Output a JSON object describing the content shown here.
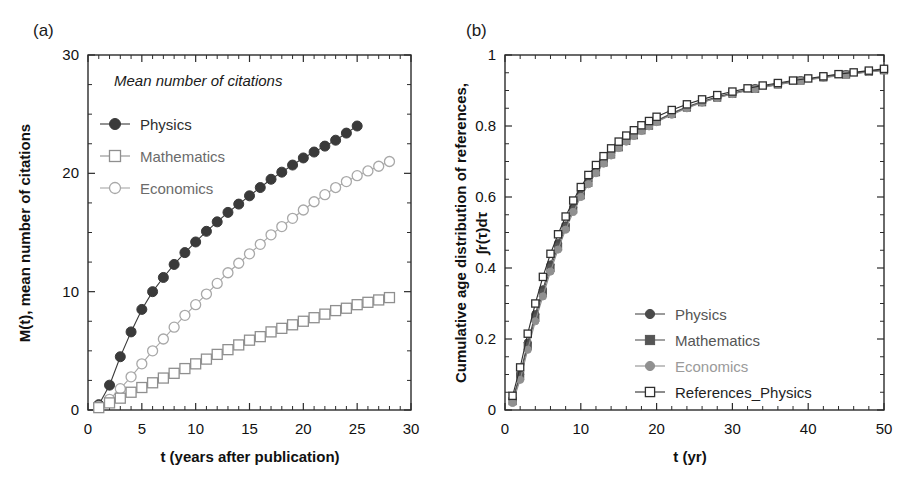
{
  "figure": {
    "panel_a_tag": "(a)",
    "panel_b_tag": "(b)"
  },
  "panel_a": {
    "legend_title": "Mean number of citations",
    "xlabel": "t (years after publication)",
    "ylabel": "M(t), mean number of citations",
    "xticks": [
      "0",
      "5",
      "10",
      "15",
      "20",
      "25",
      "30"
    ],
    "yticks": [
      "0",
      "10",
      "20",
      "30"
    ],
    "legend": [
      {
        "label": "Physics",
        "marker": "filled-circle",
        "color": "#3a3a3a"
      },
      {
        "label": "Mathematics",
        "marker": "open-square",
        "color": "#8f8f8f"
      },
      {
        "label": "Economics",
        "marker": "open-circle",
        "color": "#a8a8a8"
      }
    ]
  },
  "panel_b": {
    "xlabel": "t (yr)",
    "ylabel_line1": "Cumulative age distribution of references,",
    "ylabel_line2": "∫r(τ)dτ",
    "xticks": [
      "0",
      "10",
      "20",
      "30",
      "40",
      "50"
    ],
    "yticks": [
      "0",
      "0.2",
      "0.4",
      "0.6",
      "0.8",
      "1"
    ],
    "legend": [
      {
        "label": "Physics",
        "marker": "filled-circle",
        "color": "#4a4a4a"
      },
      {
        "label": "Mathematics",
        "marker": "filled-square",
        "color": "#555555"
      },
      {
        "label": "Economics",
        "marker": "filled-circle",
        "color": "#909090"
      },
      {
        "label": "References_Physics",
        "marker": "open-square",
        "color": "#2f2f2f"
      }
    ]
  },
  "chart_data": [
    {
      "type": "line",
      "panel": "(a)",
      "title": "Mean number of citations",
      "xlabel": "t (years after publication)",
      "ylabel": "M(t), mean number of citations",
      "xlim": [
        0,
        30
      ],
      "ylim": [
        0,
        30
      ],
      "xticks": [
        0,
        5,
        10,
        15,
        20,
        25,
        30
      ],
      "yticks": [
        0,
        10,
        20,
        30
      ],
      "grid": false,
      "legend_position": "upper-left",
      "series": [
        {
          "name": "Physics",
          "marker": "filled-circle",
          "color": "#3a3a3a",
          "x": [
            1,
            2,
            3,
            4,
            5,
            6,
            7,
            8,
            9,
            10,
            11,
            12,
            13,
            14,
            15,
            16,
            17,
            18,
            19,
            20,
            21,
            22,
            23,
            24,
            25
          ],
          "y": [
            0.45,
            2.1,
            4.5,
            6.6,
            8.5,
            10.0,
            11.2,
            12.3,
            13.3,
            14.2,
            15.1,
            15.9,
            16.7,
            17.4,
            18.1,
            18.8,
            19.5,
            20.1,
            20.7,
            21.3,
            21.8,
            22.3,
            22.8,
            23.4,
            24.0
          ]
        },
        {
          "name": "Economics",
          "marker": "open-circle",
          "color": "#a8a8a8",
          "x": [
            1,
            2,
            3,
            4,
            5,
            6,
            7,
            8,
            9,
            10,
            11,
            12,
            13,
            14,
            15,
            16,
            17,
            18,
            19,
            20,
            21,
            22,
            23,
            24,
            25,
            26,
            27,
            28
          ],
          "y": [
            0.3,
            0.9,
            1.8,
            2.8,
            3.9,
            5.0,
            6.0,
            7.0,
            8.0,
            8.9,
            9.8,
            10.7,
            11.6,
            12.4,
            13.2,
            14.0,
            14.8,
            15.5,
            16.2,
            16.9,
            17.6,
            18.2,
            18.8,
            19.3,
            19.8,
            20.2,
            20.6,
            21.0
          ]
        },
        {
          "name": "Mathematics",
          "marker": "open-square",
          "color": "#8f8f8f",
          "x": [
            1,
            2,
            3,
            4,
            5,
            6,
            7,
            8,
            9,
            10,
            11,
            12,
            13,
            14,
            15,
            16,
            17,
            18,
            19,
            20,
            21,
            22,
            23,
            24,
            25,
            26,
            27,
            28
          ],
          "y": [
            0.2,
            0.6,
            1.0,
            1.5,
            1.9,
            2.3,
            2.7,
            3.1,
            3.5,
            3.9,
            4.3,
            4.7,
            5.1,
            5.5,
            5.9,
            6.2,
            6.6,
            6.9,
            7.2,
            7.5,
            7.8,
            8.1,
            8.4,
            8.6,
            8.9,
            9.1,
            9.3,
            9.5
          ]
        }
      ]
    },
    {
      "type": "line",
      "panel": "(b)",
      "title": "",
      "xlabel": "t (yr)",
      "ylabel": "Cumulative age distribution of references, ∫r(τ)dτ",
      "xlim": [
        0,
        50
      ],
      "ylim": [
        0,
        1
      ],
      "xticks": [
        0,
        10,
        20,
        30,
        40,
        50
      ],
      "yticks": [
        0,
        0.2,
        0.4,
        0.6,
        0.8,
        1
      ],
      "grid": false,
      "legend_position": "lower-right",
      "series": [
        {
          "name": "Physics",
          "marker": "filled-circle",
          "color": "#4a4a4a",
          "x": [
            1,
            2,
            3,
            4,
            5,
            6,
            7,
            8,
            9,
            10,
            11,
            12,
            13,
            14,
            15,
            16,
            17,
            18,
            19,
            20,
            22,
            24,
            26,
            28,
            30,
            33,
            36,
            39,
            42,
            45,
            48,
            50
          ],
          "y": [
            0.03,
            0.1,
            0.19,
            0.27,
            0.34,
            0.41,
            0.47,
            0.52,
            0.57,
            0.61,
            0.645,
            0.675,
            0.7,
            0.722,
            0.742,
            0.76,
            0.776,
            0.79,
            0.803,
            0.815,
            0.836,
            0.854,
            0.869,
            0.882,
            0.893,
            0.907,
            0.919,
            0.929,
            0.938,
            0.946,
            0.954,
            0.958
          ]
        },
        {
          "name": "Mathematics",
          "marker": "filled-square",
          "color": "#555555",
          "x": [
            1,
            2,
            3,
            4,
            5,
            6,
            7,
            8,
            9,
            10,
            11,
            12,
            13,
            14,
            15,
            16,
            17,
            18,
            19,
            20,
            22,
            24,
            26,
            28,
            30,
            33,
            36,
            39,
            42,
            45,
            48,
            50
          ],
          "y": [
            0.025,
            0.095,
            0.18,
            0.26,
            0.33,
            0.4,
            0.46,
            0.515,
            0.565,
            0.605,
            0.64,
            0.67,
            0.697,
            0.72,
            0.74,
            0.758,
            0.774,
            0.788,
            0.801,
            0.813,
            0.834,
            0.852,
            0.867,
            0.88,
            0.891,
            0.905,
            0.917,
            0.928,
            0.937,
            0.945,
            0.953,
            0.957
          ]
        },
        {
          "name": "Economics",
          "marker": "filled-circle",
          "color": "#909090",
          "x": [
            1,
            2,
            3,
            4,
            5,
            6,
            7,
            8,
            9,
            10,
            11,
            12,
            13,
            14,
            15,
            16,
            17,
            18,
            19,
            20,
            22,
            24,
            26,
            28,
            30,
            33,
            36,
            39,
            42,
            45,
            48,
            50
          ],
          "y": [
            0.02,
            0.085,
            0.17,
            0.25,
            0.32,
            0.39,
            0.452,
            0.508,
            0.558,
            0.6,
            0.636,
            0.667,
            0.694,
            0.717,
            0.738,
            0.756,
            0.772,
            0.786,
            0.799,
            0.811,
            0.832,
            0.85,
            0.866,
            0.879,
            0.89,
            0.904,
            0.916,
            0.927,
            0.936,
            0.944,
            0.952,
            0.956
          ]
        },
        {
          "name": "References_Physics",
          "marker": "open-square",
          "color": "#2f2f2f",
          "x": [
            1,
            2,
            3,
            4,
            5,
            6,
            7,
            8,
            9,
            10,
            11,
            12,
            13,
            14,
            15,
            16,
            17,
            18,
            19,
            20,
            22,
            24,
            26,
            28,
            30,
            32,
            34,
            36,
            38,
            40,
            42,
            44,
            46,
            48,
            50
          ],
          "y": [
            0.04,
            0.12,
            0.215,
            0.3,
            0.375,
            0.44,
            0.495,
            0.545,
            0.59,
            0.628,
            0.662,
            0.69,
            0.715,
            0.737,
            0.756,
            0.773,
            0.788,
            0.802,
            0.814,
            0.826,
            0.845,
            0.861,
            0.875,
            0.887,
            0.897,
            0.906,
            0.914,
            0.921,
            0.928,
            0.934,
            0.94,
            0.946,
            0.951,
            0.956,
            0.961
          ]
        }
      ]
    }
  ]
}
